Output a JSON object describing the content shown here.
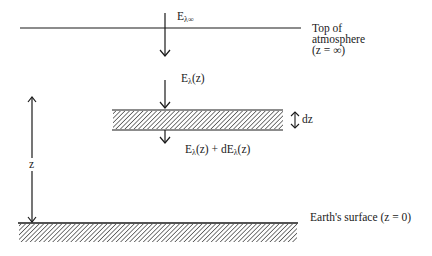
{
  "diagram": {
    "title_description": "Attenuation of downwelling irradiance through an atmospheric layer dz",
    "labels": {
      "incident_irradiance": {
        "main": "E",
        "sub": "λ∞"
      },
      "irradiance_at_z": {
        "main": "E",
        "sub": "λ",
        "tail": "(z)"
      },
      "irradiance_below": {
        "main1": "E",
        "sub1": "λ",
        "tail1": "(z) + dE",
        "sub2": "λ",
        "tail2": "(z)"
      },
      "top_of_atmosphere": [
        "Top of",
        "atmosphere",
        "(z = ∞)"
      ],
      "layer_thickness": "dz",
      "height": "z",
      "earth_surface": "Earth's surface (z = 0)"
    },
    "colors": {
      "line": "#1a1a1a",
      "hatch": "#333333",
      "background": "#ffffff"
    }
  }
}
